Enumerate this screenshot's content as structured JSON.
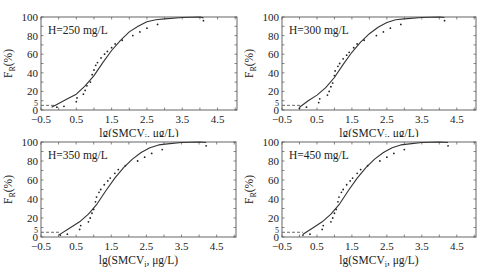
{
  "figure": {
    "ylabel_main": "F",
    "ylabel_sub": "R",
    "ylabel_suffix": "(%)",
    "xlabel_main": "lg(SMCV",
    "xlabel_sub": "i",
    "xlabel_suffix": ", μg/L)",
    "threshold_y": 5
  },
  "chart_data": [
    {
      "type": "scatter",
      "title": "H=250 mg/L",
      "xlabel": "lg(SMCVi, μg/L)",
      "ylabel": "FR(%)",
      "xlim": [
        -0.5,
        5.05
      ],
      "ylim": [
        0,
        100
      ],
      "xticks": [
        -0.5,
        0.5,
        1.5,
        2.5,
        3.5,
        4.5
      ],
      "yticks": [
        0,
        5,
        20,
        40,
        60,
        80,
        100
      ],
      "grid": false,
      "series": [
        {
          "name": "observed",
          "kind": "points",
          "x": [
            -0.05,
            0.15,
            0.5,
            0.52,
            0.7,
            0.75,
            0.8,
            0.9,
            0.95,
            1.0,
            1.05,
            1.1,
            1.2,
            1.3,
            1.38,
            1.5,
            1.6,
            1.8,
            2.1,
            2.3,
            2.5,
            2.8,
            4.1
          ],
          "y": [
            3,
            4,
            9,
            13,
            17,
            21,
            26,
            30,
            38,
            43,
            48,
            51,
            56,
            60,
            63,
            67,
            71,
            75,
            80,
            84,
            88,
            92,
            96
          ]
        },
        {
          "name": "fitted",
          "kind": "line",
          "x": [
            -0.2,
            0.0,
            0.25,
            0.5,
            0.75,
            1.0,
            1.25,
            1.5,
            1.75,
            2.0,
            2.25,
            2.5,
            2.75,
            3.0,
            3.5,
            4.0,
            4.1
          ],
          "y": [
            3,
            7,
            12,
            17,
            26,
            37,
            51,
            64,
            75,
            84,
            90,
            95,
            97,
            98,
            99.5,
            100,
            99
          ]
        }
      ],
      "threshold": {
        "y": 5,
        "x_end": -0.1
      }
    },
    {
      "type": "scatter",
      "title": "H=300 mg/L",
      "xlabel": "lg(SMCVi, μg/L)",
      "ylabel": "FR(%)",
      "xlim": [
        -0.5,
        5.05
      ],
      "ylim": [
        0,
        100
      ],
      "xticks": [
        -0.5,
        0.5,
        1.5,
        2.5,
        3.5,
        4.5
      ],
      "yticks": [
        0,
        5,
        20,
        40,
        60,
        80,
        100
      ],
      "grid": false,
      "series": [
        {
          "name": "observed",
          "kind": "points",
          "x": [
            0.0,
            0.2,
            0.55,
            0.58,
            0.8,
            0.85,
            0.9,
            0.95,
            1.0,
            1.02,
            1.1,
            1.15,
            1.25,
            1.35,
            1.42,
            1.55,
            1.65,
            1.85,
            2.2,
            2.4,
            2.6,
            2.9,
            4.15
          ],
          "y": [
            2,
            3,
            8,
            12,
            16,
            20,
            25,
            29,
            37,
            42,
            47,
            50,
            55,
            59,
            62,
            67,
            71,
            75,
            80,
            84,
            88,
            92,
            96
          ]
        },
        {
          "name": "fitted",
          "kind": "line",
          "x": [
            0.0,
            0.25,
            0.5,
            0.75,
            1.0,
            1.25,
            1.5,
            1.75,
            2.0,
            2.25,
            2.5,
            2.75,
            3.0,
            3.5,
            4.0,
            4.15
          ],
          "y": [
            3,
            10,
            16,
            24,
            35,
            49,
            62,
            73,
            82,
            89,
            94,
            97,
            98,
            99.5,
            100,
            99.5
          ]
        }
      ],
      "threshold": {
        "y": 5,
        "x_end": 0.05
      }
    },
    {
      "type": "scatter",
      "title": "H=350 mg/L",
      "xlabel": "lg(SMCVi, μg/L)",
      "ylabel": "FR(%)",
      "xlim": [
        -0.5,
        5.05
      ],
      "ylim": [
        0,
        100
      ],
      "xticks": [
        -0.5,
        0.5,
        1.5,
        2.5,
        3.5,
        4.5
      ],
      "yticks": [
        0,
        5,
        20,
        40,
        60,
        80,
        100
      ],
      "grid": false,
      "series": [
        {
          "name": "observed",
          "kind": "points",
          "x": [
            0.05,
            0.25,
            0.6,
            0.63,
            0.85,
            0.9,
            0.95,
            1.0,
            1.05,
            1.08,
            1.15,
            1.2,
            1.3,
            1.4,
            1.47,
            1.6,
            1.7,
            1.9,
            2.25,
            2.45,
            2.65,
            2.95,
            4.2
          ],
          "y": [
            2,
            3,
            8,
            12,
            16,
            20,
            25,
            29,
            37,
            42,
            47,
            50,
            55,
            59,
            62,
            67,
            71,
            75,
            80,
            84,
            88,
            92,
            96
          ]
        },
        {
          "name": "fitted",
          "kind": "line",
          "x": [
            0.0,
            0.3,
            0.6,
            0.85,
            1.1,
            1.35,
            1.6,
            1.85,
            2.1,
            2.35,
            2.6,
            2.85,
            3.1,
            3.5,
            4.0,
            4.2
          ],
          "y": [
            2,
            9,
            16,
            24,
            35,
            49,
            62,
            73,
            82,
            89,
            94,
            97,
            98,
            99.5,
            100,
            99.5
          ]
        }
      ],
      "threshold": {
        "y": 5,
        "x_end": 0.05
      }
    },
    {
      "type": "scatter",
      "title": "H=450 mg/L",
      "xlabel": "lg(SMCVi, μg/L)",
      "ylabel": "FR(%)",
      "xlim": [
        -0.5,
        5.05
      ],
      "ylim": [
        0,
        100
      ],
      "xticks": [
        -0.5,
        0.5,
        1.5,
        2.5,
        3.5,
        4.5
      ],
      "yticks": [
        0,
        5,
        20,
        40,
        60,
        80,
        100
      ],
      "grid": false,
      "series": [
        {
          "name": "observed",
          "kind": "points",
          "x": [
            0.1,
            0.3,
            0.65,
            0.68,
            0.9,
            0.95,
            1.0,
            1.05,
            1.1,
            1.13,
            1.2,
            1.25,
            1.35,
            1.45,
            1.52,
            1.65,
            1.75,
            1.95,
            2.3,
            2.5,
            2.7,
            3.0,
            4.25
          ],
          "y": [
            2,
            3,
            8,
            12,
            16,
            20,
            25,
            29,
            37,
            42,
            47,
            50,
            55,
            59,
            62,
            67,
            71,
            75,
            80,
            84,
            88,
            92,
            96
          ]
        },
        {
          "name": "fitted",
          "kind": "line",
          "x": [
            0.1,
            0.4,
            0.65,
            0.9,
            1.15,
            1.4,
            1.65,
            1.9,
            2.15,
            2.4,
            2.65,
            2.9,
            3.15,
            3.5,
            4.0,
            4.25
          ],
          "y": [
            3,
            10,
            16,
            24,
            35,
            49,
            62,
            73,
            82,
            89,
            94,
            97,
            98,
            99.5,
            100,
            99.5
          ]
        }
      ],
      "threshold": {
        "y": 5,
        "x_end": 0.1
      }
    }
  ]
}
